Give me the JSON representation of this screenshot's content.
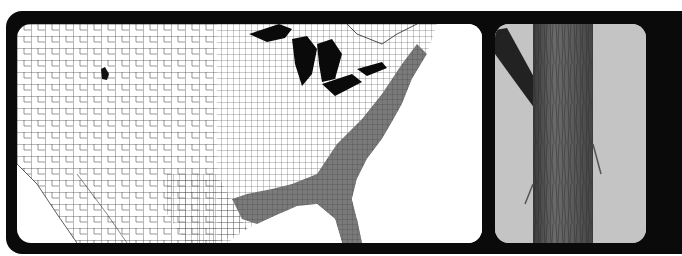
{
  "figure": {
    "map": {
      "subject": "county-level range map of the United States",
      "shaded_region_color": "#7a7a7a",
      "marked_county_color": "#111111",
      "water_color": "#0a0a0a",
      "land_color": "#ffffff",
      "border_color": "#222222"
    },
    "photo": {
      "subject": "tree trunk bark photograph",
      "background_color": "#c4c4c4",
      "bark_color": "#5a5a5a"
    },
    "frame_color": "#0a0a0a"
  }
}
